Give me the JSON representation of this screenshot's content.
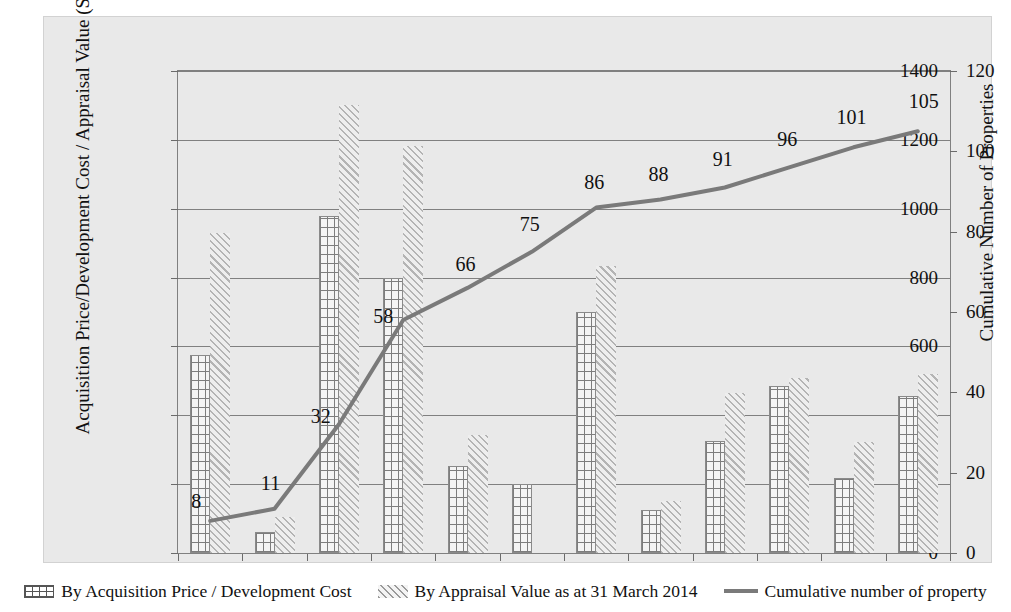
{
  "chart_data": {
    "type": "bar",
    "title": "",
    "subtitle": "",
    "xlabel": "",
    "ylabel": "Acquisition Price/Development Cost / Appraisal Value (S$ million)",
    "y2label": "Cumulative Number of Properties",
    "categories": [
      "2002",
      "2003",
      "2004",
      "2005",
      "2006",
      "2007",
      "2008",
      "2009",
      "2010",
      "2011",
      "2012",
      "2013"
    ],
    "ylim": [
      0,
      1400
    ],
    "y2lim": [
      0,
      120
    ],
    "yticks": [
      "0",
      "200",
      "400",
      "600",
      "800",
      "1000",
      "1200",
      "1400"
    ],
    "y2ticks": [
      "0",
      "20",
      "40",
      "60",
      "80",
      "100",
      "120"
    ],
    "grid": true,
    "legend_position": "bottom",
    "series": [
      {
        "name": "By Acquisition Price / Development Cost",
        "type": "bar",
        "axis": "left",
        "values": [
          575,
          62,
          980,
          800,
          253,
          200,
          700,
          125,
          325,
          485,
          218,
          455
        ]
      },
      {
        "name": "By Appraisal Value as at 31 March 2014",
        "type": "bar",
        "axis": "left",
        "values": [
          930,
          105,
          1302,
          1182,
          343,
          0,
          835,
          152,
          465,
          508,
          322,
          520
        ]
      },
      {
        "name": "Cumulative number of property",
        "type": "line",
        "axis": "right",
        "values": [
          8,
          11,
          32,
          58,
          66,
          75,
          86,
          88,
          91,
          96,
          101,
          105
        ],
        "point_labels": [
          "8",
          "11",
          "32",
          "58",
          "66",
          "75",
          "86",
          "88",
          "91",
          "96",
          "101",
          "105"
        ],
        "color": "#7a7a7a"
      }
    ]
  },
  "legend": {
    "items": [
      {
        "label": "By Acquisition Price / Development Cost",
        "icon": "grid-pattern-swatch"
      },
      {
        "label": "By Appraisal Value as at 31 March 2014",
        "icon": "diagonal-hatch-swatch"
      },
      {
        "label": "Cumulative number of property",
        "icon": "line-swatch"
      }
    ]
  },
  "colors": {
    "plot_background": "#e9e9e9",
    "gridline": "#808080",
    "line_series": "#7a7a7a",
    "text": "#111111"
  }
}
